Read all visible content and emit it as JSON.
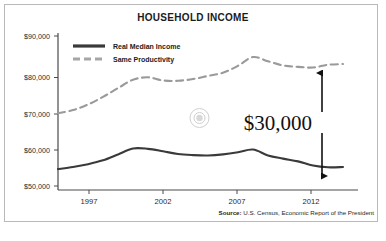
{
  "chart_data": {
    "type": "line",
    "title": "HOUSEHOLD INCOME",
    "xlabel": "",
    "ylabel": "",
    "grid": false,
    "legend_position": "top-left inside plot",
    "xlim": [
      1994,
      2014
    ],
    "ylim": [
      46000,
      91000
    ],
    "ytick_labels": [
      "$90,000",
      "$80,000",
      "$70,000",
      "$60,000",
      "$50,000"
    ],
    "ytick_values": [
      90000,
      80000,
      70000,
      60000,
      50000
    ],
    "xtick_labels": [
      "1997",
      "2002",
      "2007",
      "2012"
    ],
    "xtick_values": [
      1997,
      2002,
      2007,
      2012
    ],
    "x": [
      1994,
      1995,
      1996,
      1997,
      1998,
      1999,
      2000,
      2001,
      2002,
      2003,
      2004,
      2005,
      2006,
      2007,
      2008,
      2009,
      2010,
      2011,
      2012,
      2013
    ],
    "series": [
      {
        "name": "Real Median Income",
        "style": "solid",
        "color": "#3a3a3a",
        "values": [
          52000,
          52600,
          53400,
          54500,
          56200,
          57900,
          57800,
          57100,
          56300,
          56000,
          55900,
          56200,
          56800,
          57600,
          55900,
          55000,
          54200,
          53000,
          52500,
          52600
        ]
      },
      {
        "name": "Same Productivity",
        "style": "dashed",
        "color": "#9a9a9a",
        "values": [
          68000,
          68900,
          70500,
          72700,
          75200,
          77600,
          78300,
          77400,
          77300,
          77800,
          78700,
          79600,
          81600,
          84100,
          82900,
          81700,
          81300,
          81100,
          81900,
          82100
        ]
      }
    ],
    "annotation": {
      "label": "$30,000",
      "kind": "double-headed-arrow",
      "from_value": 82000,
      "to_value": 52600,
      "at_x": 2013
    },
    "watermark": {
      "kind": "concentric-circle-target",
      "at_x": 2004.5,
      "at_y": 68000
    },
    "source": {
      "prefix": "Source:",
      "text": " U.S. Census, Economic Report of the President"
    }
  }
}
